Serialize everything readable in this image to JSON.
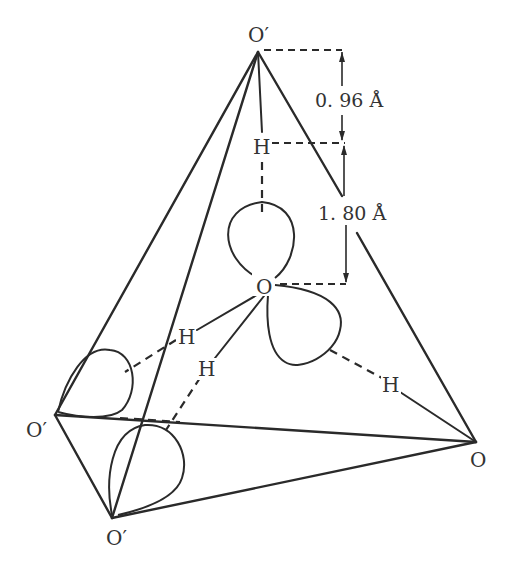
{
  "diagram": {
    "atoms": {
      "top": {
        "label": "O′"
      },
      "left": {
        "label": "O′"
      },
      "bottom": {
        "label": "O′"
      },
      "right": {
        "label": "O"
      },
      "center": {
        "label": "O"
      },
      "h_top": {
        "label": "H"
      },
      "h_left_upper": {
        "label": "H"
      },
      "h_left_lower": {
        "label": "H"
      },
      "h_right": {
        "label": "H"
      }
    },
    "dimensions": {
      "oh_bond": "0. 96 Å",
      "h_bond": "1. 80 Å"
    },
    "colors": {
      "line": "#2a2a2a",
      "text": "#333333",
      "background": "#ffffff"
    }
  }
}
